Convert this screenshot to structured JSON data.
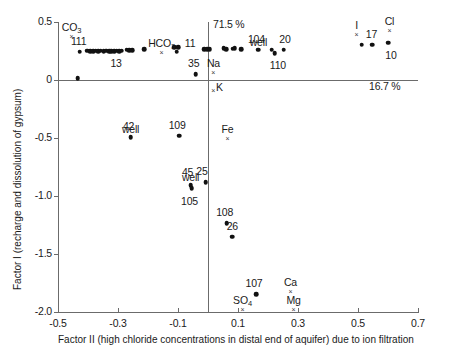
{
  "chart_data": {
    "type": "scatter",
    "title": "",
    "xlabel": "Factor II (high chloride concentrations in distal end of aquifer) due to ion filtration",
    "ylabel": "Factor I (recharge and dissolution of gypsum)",
    "xlim": [
      -0.5,
      0.7
    ],
    "ylim": [
      -2.0,
      0.5
    ],
    "xticks": [
      -0.5,
      -0.3,
      -0.1,
      0.1,
      0.3,
      0.5,
      0.7
    ],
    "xticklabels": [
      "-0.5",
      "-0.3",
      "-0.1",
      "0.1",
      "0.3",
      "0.5",
      "0.7"
    ],
    "yticks": [
      0.5,
      0,
      -0.5,
      -1.0,
      -1.5,
      -2.0
    ],
    "yticklabels": [
      "0.5",
      "0",
      "-0.5",
      "-1.0",
      "-1.5",
      "-2.0"
    ],
    "grid": false,
    "legend": null,
    "annotations": [
      {
        "text": "71.5 %",
        "x": 0.01,
        "y": 0.47,
        "name": "factor-i-variance"
      },
      {
        "text": "16.7 %",
        "x": 0.53,
        "y": -0.06,
        "name": "factor-ii-variance"
      }
    ],
    "variables": [
      {
        "label": "CO3",
        "display": "CO",
        "sub": "3",
        "x": -0.455,
        "y": 0.38,
        "label_dx": 0,
        "label_dy": -9
      },
      {
        "label": "HCO3",
        "display": "HCO",
        "sub": "3",
        "x": -0.155,
        "y": 0.245,
        "label_dx": 0,
        "label_dy": -9
      },
      {
        "label": "Na",
        "display": "Na",
        "sub": "",
        "x": 0.018,
        "y": 0.065,
        "label_dx": 0,
        "label_dy": -9
      },
      {
        "label": "K",
        "display": "K",
        "sub": "",
        "x": 0.018,
        "y": -0.085,
        "label_dx": 6,
        "label_dy": -3
      },
      {
        "label": "Fe",
        "display": "Fe",
        "sub": "",
        "x": 0.065,
        "y": -0.5,
        "label_dx": 0,
        "label_dy": -9
      },
      {
        "label": "Ca",
        "display": "Ca",
        "sub": "",
        "x": 0.275,
        "y": -1.82,
        "label_dx": 0,
        "label_dy": -9
      },
      {
        "label": "Mg",
        "display": "Mg",
        "sub": "",
        "x": 0.285,
        "y": -1.97,
        "label_dx": 0,
        "label_dy": -9
      },
      {
        "label": "SO4",
        "display": "SO",
        "sub": "4",
        "x": 0.115,
        "y": -1.97,
        "label_dx": 0,
        "label_dy": -9
      },
      {
        "label": "Cl",
        "display": "Cl",
        "sub": "",
        "x": 0.605,
        "y": 0.43,
        "label_dx": 0,
        "label_dy": -9
      },
      {
        "label": "I",
        "display": "I",
        "sub": "",
        "x": 0.495,
        "y": 0.4,
        "label_dx": 0,
        "label_dy": -9
      }
    ],
    "points": [
      {
        "x": -0.435,
        "y": 0.015,
        "label": null
      },
      {
        "x": -0.428,
        "y": 0.245,
        "label": "111",
        "label_dx": -1,
        "label_dy": -11
      },
      {
        "x": -0.402,
        "y": 0.253,
        "label": null
      },
      {
        "x": -0.392,
        "y": 0.25,
        "label": null
      },
      {
        "x": -0.383,
        "y": 0.248,
        "label": null
      },
      {
        "x": -0.374,
        "y": 0.252,
        "label": null
      },
      {
        "x": -0.366,
        "y": 0.247,
        "label": null
      },
      {
        "x": -0.357,
        "y": 0.251,
        "label": null
      },
      {
        "x": -0.348,
        "y": 0.249,
        "label": null
      },
      {
        "x": -0.339,
        "y": 0.254,
        "label": null
      },
      {
        "x": -0.33,
        "y": 0.248,
        "label": null
      },
      {
        "x": -0.322,
        "y": 0.246,
        "label": null
      },
      {
        "x": -0.313,
        "y": 0.25,
        "label": "13",
        "label_dx": 2,
        "label_dy": 12
      },
      {
        "x": -0.304,
        "y": 0.252,
        "label": null
      },
      {
        "x": -0.296,
        "y": 0.247,
        "label": null
      },
      {
        "x": -0.287,
        "y": 0.251,
        "label": null
      },
      {
        "x": -0.271,
        "y": 0.262,
        "label": null
      },
      {
        "x": -0.262,
        "y": 0.258,
        "label": null
      },
      {
        "x": -0.253,
        "y": 0.256,
        "label": null
      },
      {
        "x": -0.213,
        "y": 0.268,
        "label": null
      },
      {
        "x": -0.112,
        "y": 0.285,
        "label": null
      },
      {
        "x": -0.1,
        "y": 0.283,
        "label": null
      },
      {
        "x": -0.104,
        "y": 0.245,
        "label": null
      },
      {
        "x": -0.041,
        "y": 0.05,
        "label": "35",
        "label_dx": -2,
        "label_dy": -11
      },
      {
        "x": -0.013,
        "y": 0.268,
        "label": "11",
        "label_dx": -14,
        "label_dy": -6
      },
      {
        "x": -0.003,
        "y": 0.266,
        "label": null
      },
      {
        "x": 0.006,
        "y": 0.264,
        "label": null
      },
      {
        "x": 0.052,
        "y": 0.272,
        "label": null
      },
      {
        "x": 0.06,
        "y": 0.268,
        "label": null
      },
      {
        "x": 0.082,
        "y": 0.27,
        "label": null
      },
      {
        "x": 0.089,
        "y": 0.272,
        "label": null
      },
      {
        "x": 0.11,
        "y": 0.268,
        "label": null
      },
      {
        "x": 0.168,
        "y": 0.26,
        "label": "104",
        "label_dx": -2,
        "label_dy": -11
      },
      {
        "x": 0.212,
        "y": 0.26,
        "label": null
      },
      {
        "x": 0.223,
        "y": 0.232,
        "label": "110",
        "label_dx": 3,
        "label_dy": 12
      },
      {
        "x": 0.253,
        "y": 0.262,
        "label": "20",
        "label_dx": 1,
        "label_dy": -11
      },
      {
        "x": 0.512,
        "y": 0.305,
        "label": null
      },
      {
        "x": 0.548,
        "y": 0.303,
        "label": "17",
        "label_dx": -1,
        "label_dy": -11
      },
      {
        "x": 0.6,
        "y": 0.32,
        "label": "10",
        "label_dx": 3,
        "label_dy": 12
      },
      {
        "x": -0.258,
        "y": -0.495,
        "label": "42",
        "label_dx": -2,
        "label_dy": -11
      },
      {
        "x": -0.096,
        "y": -0.48,
        "label": "109",
        "label_dx": -2,
        "label_dy": -11
      },
      {
        "x": -0.058,
        "y": -0.905,
        "label": "45",
        "label_dx": -3,
        "label_dy": -13
      },
      {
        "x": -0.055,
        "y": -0.935,
        "label": "105",
        "label_dx": -2,
        "label_dy": 13
      },
      {
        "x": -0.007,
        "y": -0.88,
        "label": "25",
        "label_dx": -4,
        "label_dy": -11
      },
      {
        "x": 0.062,
        "y": -1.235,
        "label": "108",
        "label_dx": -2,
        "label_dy": -11
      },
      {
        "x": 0.081,
        "y": -1.35,
        "label": "26",
        "label_dx": 0,
        "label_dy": -11
      },
      {
        "x": 0.16,
        "y": -1.845,
        "label": "107",
        "label_dx": -2,
        "label_dy": -11
      }
    ],
    "well_annotations": [
      {
        "text": "well",
        "x": -0.258,
        "y": -0.425,
        "name": "well-label-42"
      },
      {
        "text": "well",
        "x": -0.058,
        "y": -0.835,
        "name": "well-label-45"
      },
      {
        "text": "well",
        "x": 0.168,
        "y": 0.33,
        "name": "well-label-104"
      }
    ]
  }
}
